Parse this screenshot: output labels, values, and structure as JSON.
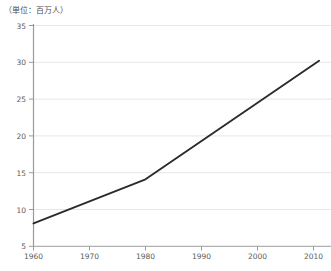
{
  "chart_data": {
    "type": "line",
    "title": "",
    "subtitle": "",
    "unit_note": "（単位：百万人）",
    "xlabel": "",
    "ylabel": "",
    "xlim": [
      1960,
      2011
    ],
    "ylim": [
      5,
      35
    ],
    "grid": true,
    "legend": null,
    "x_ticks": [
      "1960",
      "1970",
      "1980",
      "1990",
      "2000",
      "2010"
    ],
    "y_ticks": [
      "5",
      "10",
      "15",
      "20",
      "25",
      "30",
      "35"
    ],
    "series": [
      {
        "name": "人口",
        "color": "#2b2b2b",
        "x": [
          1960,
          1980,
          2011
        ],
        "values": [
          8.1,
          14.1,
          30.2
        ]
      }
    ]
  },
  "axes": {
    "unit_note": "（単位：百万人）",
    "y_ticks": [
      {
        "label": "35",
        "value": 35
      },
      {
        "label": "30",
        "value": 30
      },
      {
        "label": "25",
        "value": 25
      },
      {
        "label": "20",
        "value": 20
      },
      {
        "label": "15",
        "value": 15
      },
      {
        "label": "10",
        "value": 10
      },
      {
        "label": "5",
        "value": 5
      }
    ],
    "x_ticks": [
      {
        "label": "1960",
        "value": 1960
      },
      {
        "label": "1970",
        "value": 1970
      },
      {
        "label": "1980",
        "value": 1980
      },
      {
        "label": "1990",
        "value": 1990
      },
      {
        "label": "2000",
        "value": 2000
      },
      {
        "label": "2010",
        "value": 2010
      }
    ]
  },
  "colors": {
    "line": "#2b2b2b",
    "grid": "#e2e2e2",
    "axis": "#9a9a9a",
    "text": "#5a5a5a"
  }
}
